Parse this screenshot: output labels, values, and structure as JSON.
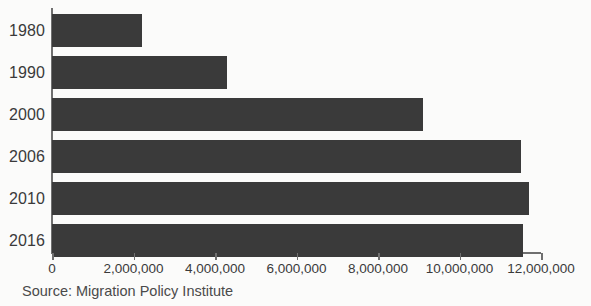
{
  "chart_data": {
    "type": "bar",
    "orientation": "horizontal",
    "title": "",
    "xlabel": "",
    "ylabel": "",
    "categories": [
      "1980",
      "1990",
      "2000",
      "2006",
      "2010",
      "2016"
    ],
    "values": [
      2200000,
      4300000,
      9100000,
      11500000,
      11700000,
      11550000
    ],
    "xlim": [
      0,
      12000000
    ],
    "xticks": [
      0,
      2000000,
      4000000,
      6000000,
      8000000,
      10000000,
      12000000
    ],
    "xtick_labels": [
      "0",
      "2,000,000",
      "4,000,000",
      "6,000,000",
      "8,000,000",
      "10,000,000",
      "12,000,000"
    ],
    "grid": false,
    "legend": false,
    "bar_color": "#3a3a3a",
    "axis_color": "#6f6f6f",
    "background_color": "#fbfbfa"
  },
  "source": {
    "text": "Source: Migration Policy Institute"
  }
}
